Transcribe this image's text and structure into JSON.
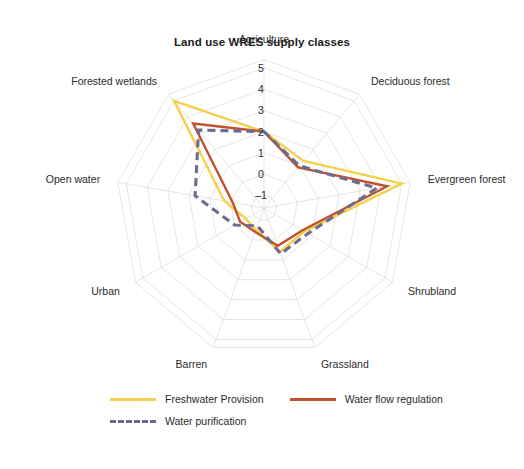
{
  "chart_data": {
    "type": "radar",
    "title": "Land use WRES supply classes",
    "categories": [
      "Agriculture",
      "Deciduous forest",
      "Evergreen forest",
      "Shrubland",
      "Grassland",
      "Barren",
      "Urban",
      "Open water",
      "Forested wetlands"
    ],
    "radial_ticks": [
      "5",
      "4",
      "3",
      "2",
      "1",
      "0",
      "-1"
    ],
    "rlim": [
      -1.6,
      5.4
    ],
    "grid": true,
    "legend_position": "bottom",
    "xlabel": "",
    "ylabel": "",
    "series": [
      {
        "name": "Freshwater Provision",
        "color": "#f5d04e",
        "style": "solid",
        "values": [
          2.0,
          1.3,
          5.0,
          0.6,
          0.6,
          -0.5,
          -0.6,
          0.3,
          5.0
        ]
      },
      {
        "name": "Water flow regulation",
        "color": "#c0532e",
        "style": "solid",
        "values": [
          2.0,
          0.9,
          4.3,
          0.5,
          0.3,
          -0.4,
          -0.3,
          -0.1,
          3.6
        ]
      },
      {
        "name": "Water purification",
        "color": "#6b6b93",
        "style": "dashed",
        "values": [
          2.0,
          1.0,
          3.8,
          0.8,
          0.7,
          -0.7,
          0.0,
          1.7,
          3.2
        ]
      }
    ]
  },
  "legend": {
    "items": [
      {
        "label": "Freshwater Provision",
        "color": "#f5d04e",
        "style": "solid"
      },
      {
        "label": "Water flow regulation",
        "color": "#c0532e",
        "style": "solid"
      },
      {
        "label": "Water purification",
        "color": "#6b6b93",
        "style": "dashed"
      }
    ]
  }
}
